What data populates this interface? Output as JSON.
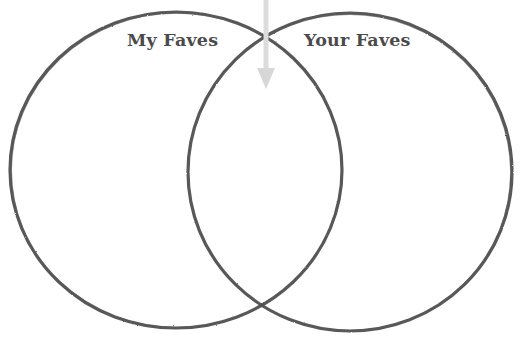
{
  "diagram": {
    "type": "venn",
    "title": "",
    "background_color": "#ffffff",
    "width": 521,
    "height": 337,
    "stroke_color": "#4a4a4a",
    "stroke_width": 3,
    "sets": [
      {
        "id": "left",
        "label": "My Faves",
        "center_x": 176,
        "center_y": 170,
        "radius": 166,
        "label_x": 127,
        "label_y": 30
      },
      {
        "id": "right",
        "label": "Your Faves",
        "center_x": 350,
        "center_y": 172,
        "radius": 162,
        "label_x": 304,
        "label_y": 30
      }
    ],
    "intersection": {
      "label": "",
      "upper_crossing_x": 266,
      "upper_crossing_y": 36,
      "lower_crossing_x": 266,
      "lower_crossing_y": 305
    },
    "annotations": [
      {
        "id": "intersection-arrow",
        "icon": "down-arrow-icon",
        "label": "",
        "color": "#d9d9d9",
        "x": 266,
        "y_start": 0,
        "y_tip": 88,
        "shaft_width": 5,
        "head_width": 18
      }
    ]
  }
}
